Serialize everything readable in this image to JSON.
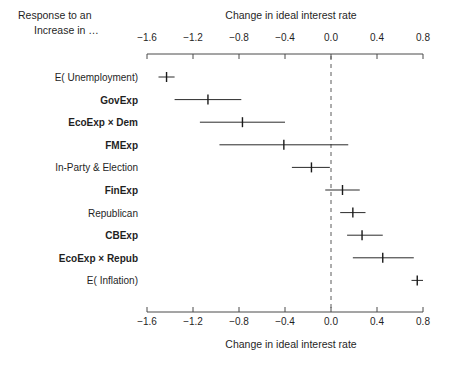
{
  "header": {
    "left_line1": "Response to an",
    "left_line2": "Increase in …",
    "top_axis_title": "Change in ideal interest rate",
    "bottom_axis_title": "Change in ideal interest rate"
  },
  "chart_data": {
    "type": "scatter",
    "title": "",
    "xlabel": "Change in ideal interest rate",
    "ylabel": "Response to an Increase in …",
    "xlim": [
      -1.75,
      0.85
    ],
    "xticks": [
      -1.6,
      -1.2,
      -0.8,
      -0.4,
      0.0,
      0.4,
      0.8
    ],
    "xticklabels": [
      "−1.6",
      "−1.2",
      "−0.8",
      "−0.4",
      "0.0",
      "0.4",
      "0.8"
    ],
    "grid": false,
    "legend": false,
    "reference_line": 0.0,
    "reference_line_style": "dashed",
    "orientation": "horizontal",
    "categories": [
      "E( Unemployment)",
      "GovExp",
      "EcoExp × Dem",
      "FMExp",
      "In-Party & Election",
      "FinExp",
      "Republican",
      "CBExp",
      "EcoExp × Repub",
      "E( Inflation)"
    ],
    "category_bold": [
      false,
      true,
      true,
      true,
      false,
      true,
      false,
      true,
      true,
      false
    ],
    "values": [
      -1.43,
      -1.07,
      -0.77,
      -0.41,
      -0.17,
      0.1,
      0.19,
      0.27,
      0.45,
      0.75
    ],
    "ci_low": [
      -1.5,
      -1.36,
      -1.14,
      -0.97,
      -0.34,
      -0.05,
      0.08,
      0.14,
      0.19,
      0.7
    ],
    "ci_high": [
      -1.36,
      -0.78,
      -0.4,
      0.15,
      -0.01,
      0.25,
      0.3,
      0.45,
      0.72,
      0.8
    ]
  }
}
